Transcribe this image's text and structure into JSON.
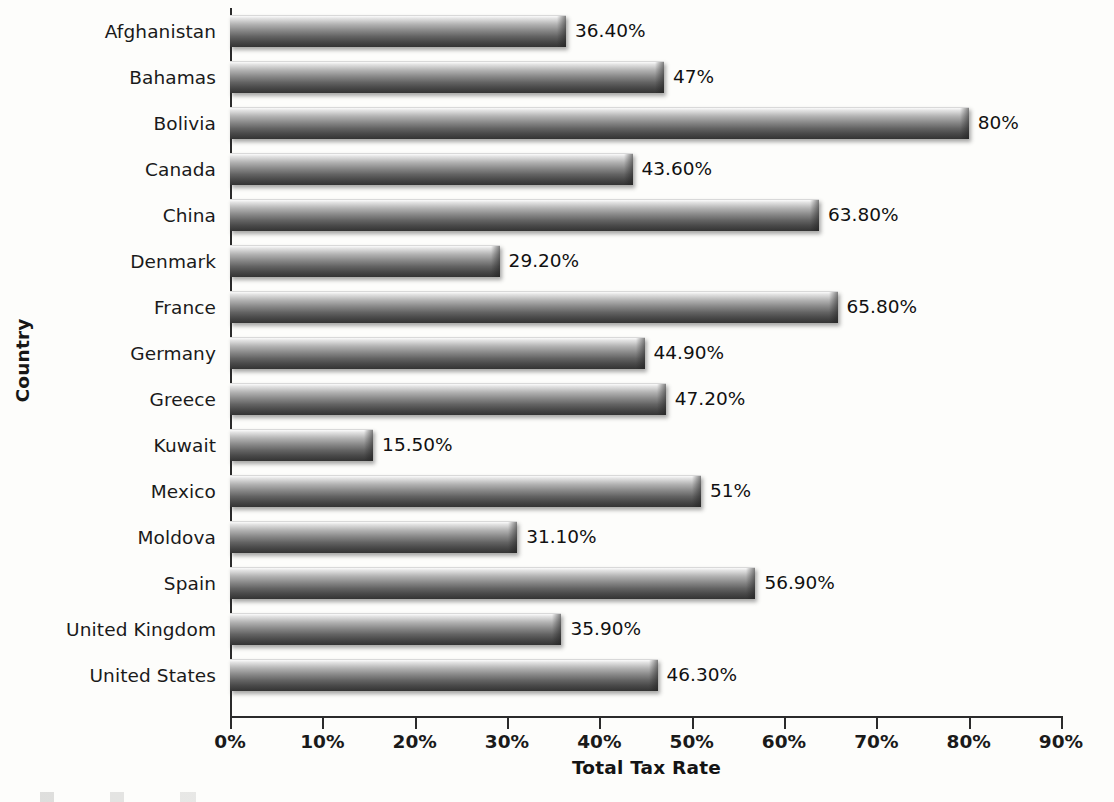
{
  "chart_data": {
    "type": "bar",
    "orientation": "horizontal",
    "title": "",
    "xlabel": "Total Tax Rate",
    "ylabel": "Country",
    "xlim": [
      0,
      90
    ],
    "xticks": [
      "0%",
      "10%",
      "20%",
      "30%",
      "40%",
      "50%",
      "60%",
      "70%",
      "80%",
      "90%"
    ],
    "xtick_values": [
      0,
      10,
      20,
      30,
      40,
      50,
      60,
      70,
      80,
      90
    ],
    "grid": false,
    "legend": "none",
    "categories": [
      "Afghanistan",
      "Bahamas",
      "Bolivia",
      "Canada",
      "China",
      "Denmark",
      "France",
      "Germany",
      "Greece",
      "Kuwait",
      "Mexico",
      "Moldova",
      "Spain",
      "United Kingdom",
      "United States"
    ],
    "values": [
      36.4,
      47,
      80,
      43.6,
      63.8,
      29.2,
      65.8,
      44.9,
      47.2,
      15.5,
      51,
      31.1,
      56.9,
      35.9,
      46.3
    ],
    "value_labels": [
      "36.40%",
      "47%",
      "80%",
      "43.60%",
      "63.80%",
      "29.20%",
      "65.80%",
      "44.90%",
      "47.20%",
      "15.50%",
      "51%",
      "31.10%",
      "56.90%",
      "35.90%",
      "46.30%"
    ],
    "series": [
      {
        "name": "Total Tax Rate",
        "values": [
          36.4,
          47,
          80,
          43.6,
          63.8,
          29.2,
          65.8,
          44.9,
          47.2,
          15.5,
          51,
          31.1,
          56.9,
          35.9,
          46.3
        ]
      }
    ],
    "colors": {
      "bar_light": "#fbfbfb",
      "bar_dark": "#343434",
      "axis": "#2b2b2b",
      "text": "#141414",
      "background": "#fdfdfb"
    }
  }
}
